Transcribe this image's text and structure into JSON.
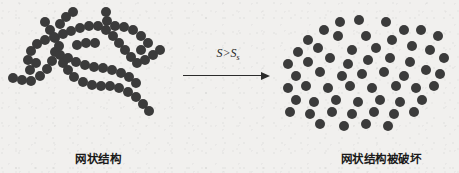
{
  "figure": {
    "background_color": "#f1f0ee",
    "particle_color": "#3b3b3b",
    "text_color": "#1a1a1a",
    "width": 459,
    "height": 173
  },
  "left_panel": {
    "caption": "网状结构",
    "caption_meaning": "network structure",
    "particle_diameter": 10,
    "particles": [
      [
        13,
        78
      ],
      [
        22,
        80
      ],
      [
        31,
        81
      ],
      [
        40,
        76
      ],
      [
        47,
        69
      ],
      [
        52,
        61
      ],
      [
        55,
        52
      ],
      [
        45,
        22
      ],
      [
        50,
        30
      ],
      [
        55,
        38
      ],
      [
        59,
        46
      ],
      [
        60,
        55
      ],
      [
        63,
        63
      ],
      [
        68,
        70
      ],
      [
        74,
        77
      ],
      [
        83,
        82
      ],
      [
        92,
        85
      ],
      [
        101,
        86
      ],
      [
        110,
        86
      ],
      [
        119,
        88
      ],
      [
        128,
        92
      ],
      [
        136,
        97
      ],
      [
        143,
        104
      ],
      [
        149,
        111
      ],
      [
        30,
        70
      ],
      [
        36,
        63
      ],
      [
        28,
        60
      ],
      [
        31,
        51
      ],
      [
        37,
        44
      ],
      [
        45,
        40
      ],
      [
        54,
        37
      ],
      [
        63,
        34
      ],
      [
        71,
        31
      ],
      [
        80,
        28
      ],
      [
        89,
        26
      ],
      [
        98,
        26
      ],
      [
        106,
        30
      ],
      [
        113,
        36
      ],
      [
        119,
        43
      ],
      [
        125,
        50
      ],
      [
        131,
        57
      ],
      [
        137,
        63
      ],
      [
        145,
        60
      ],
      [
        153,
        55
      ],
      [
        160,
        50
      ],
      [
        106,
        12
      ],
      [
        107,
        21
      ],
      [
        115,
        26
      ],
      [
        124,
        27
      ],
      [
        133,
        30
      ],
      [
        141,
        36
      ],
      [
        148,
        43
      ],
      [
        141,
        50
      ],
      [
        68,
        58
      ],
      [
        76,
        62
      ],
      [
        85,
        65
      ],
      [
        94,
        67
      ],
      [
        103,
        68
      ],
      [
        112,
        70
      ],
      [
        121,
        73
      ],
      [
        129,
        77
      ],
      [
        136,
        83
      ],
      [
        77,
        45
      ],
      [
        86,
        43
      ],
      [
        95,
        43
      ],
      [
        60,
        24
      ],
      [
        66,
        17
      ],
      [
        73,
        12
      ]
    ]
  },
  "transition": {
    "condition_base": "S>S",
    "condition_subscript": "s",
    "arrow_direction": "right"
  },
  "right_panel": {
    "caption": "网状结构被破坏",
    "caption_meaning": "network structure is destroyed",
    "particle_diameter": 10,
    "particles": [
      [
        340,
        22
      ],
      [
        359,
        20
      ],
      [
        386,
        22
      ],
      [
        324,
        30
      ],
      [
        404,
        30
      ],
      [
        421,
        30
      ],
      [
        308,
        40
      ],
      [
        338,
        36
      ],
      [
        366,
        36
      ],
      [
        392,
        40
      ],
      [
        438,
        36
      ],
      [
        298,
        52
      ],
      [
        318,
        48
      ],
      [
        352,
        50
      ],
      [
        376,
        48
      ],
      [
        412,
        46
      ],
      [
        430,
        50
      ],
      [
        288,
        64
      ],
      [
        308,
        62
      ],
      [
        330,
        58
      ],
      [
        348,
        64
      ],
      [
        368,
        60
      ],
      [
        390,
        58
      ],
      [
        410,
        62
      ],
      [
        444,
        58
      ],
      [
        296,
        76
      ],
      [
        320,
        72
      ],
      [
        342,
        76
      ],
      [
        362,
        74
      ],
      [
        384,
        72
      ],
      [
        404,
        76
      ],
      [
        426,
        70
      ],
      [
        440,
        74
      ],
      [
        288,
        88
      ],
      [
        306,
        86
      ],
      [
        328,
        88
      ],
      [
        350,
        86
      ],
      [
        372,
        88
      ],
      [
        396,
        86
      ],
      [
        416,
        88
      ],
      [
        434,
        86
      ],
      [
        296,
        100
      ],
      [
        314,
        102
      ],
      [
        336,
        100
      ],
      [
        358,
        102
      ],
      [
        380,
        100
      ],
      [
        400,
        102
      ],
      [
        422,
        100
      ],
      [
        290,
        112
      ],
      [
        310,
        114
      ],
      [
        332,
        112
      ],
      [
        352,
        114
      ],
      [
        374,
        112
      ],
      [
        394,
        114
      ],
      [
        414,
        112
      ],
      [
        320,
        124
      ],
      [
        344,
        126
      ],
      [
        366,
        124
      ],
      [
        388,
        126
      ]
    ]
  }
}
